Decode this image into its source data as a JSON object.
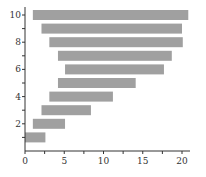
{
  "chart_data": {
    "type": "bar",
    "orientation": "horizontal",
    "title": "",
    "xlabel": "",
    "ylabel": "",
    "xlim": [
      0,
      21
    ],
    "ylim": [
      0,
      10.5
    ],
    "grid": false,
    "bar_color": "#a0a0a0",
    "x_ticks": [
      0,
      5,
      10,
      15,
      20
    ],
    "y_ticks": [
      2,
      4,
      6,
      8,
      10
    ],
    "y_minor_ticks": [
      1,
      3,
      5,
      7,
      9
    ],
    "bars": [
      {
        "y": 1,
        "left": 0.0,
        "right": 2.6
      },
      {
        "y": 2,
        "left": 1.0,
        "right": 5.1
      },
      {
        "y": 3,
        "left": 2.1,
        "right": 8.4
      },
      {
        "y": 4,
        "left": 3.1,
        "right": 11.2
      },
      {
        "y": 5,
        "left": 4.2,
        "right": 14.1
      },
      {
        "y": 6,
        "left": 5.1,
        "right": 17.7
      },
      {
        "y": 7,
        "left": 4.2,
        "right": 18.7
      },
      {
        "y": 8,
        "left": 3.1,
        "right": 20.1
      },
      {
        "y": 9,
        "left": 2.1,
        "right": 20.0
      },
      {
        "y": 10,
        "left": 1.0,
        "right": 20.8
      }
    ]
  }
}
